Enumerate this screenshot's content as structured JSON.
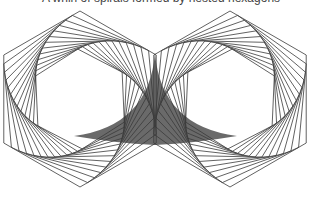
{
  "caption": {
    "text": "A whirl of spirals formed by nested hexagons"
  },
  "figure": {
    "type": "whirl-hexagons",
    "hexagons": [
      {
        "name": "left",
        "center": [
          80,
          99
        ],
        "radius": 88,
        "direction": "ccw"
      },
      {
        "name": "right",
        "center": [
          230,
          99
        ],
        "radius": 88,
        "direction": "cw"
      }
    ],
    "iterations": 13,
    "step_fraction": 0.1,
    "shared_edge": {
      "x": 155,
      "y_top": 53,
      "y_bottom": 145
    },
    "shaded_region": {
      "top_tip": [
        155,
        53
      ],
      "left_tip": [
        74,
        136
      ],
      "bottom_tip": [
        155,
        145
      ],
      "right_tip": [
        237,
        136
      ]
    },
    "colors": {
      "stroke": "#3a3a3a",
      "shade": "#6a6a6a",
      "background": "#ffffff"
    }
  }
}
